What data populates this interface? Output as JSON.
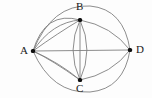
{
  "figure": {
    "name": "multigraph-abcd",
    "width": 152,
    "height": 98,
    "background_color": "#fdfdfd",
    "edge_color": "#808080",
    "vertex_color": "#101010",
    "label_color": "#1a1a1a"
  },
  "graph_data": {
    "type": "graph",
    "kind": "undirected-multigraph",
    "vertices": [
      {
        "id": "A",
        "label": "A",
        "x": 33,
        "y": 51,
        "label_x": 20,
        "label_y": 45
      },
      {
        "id": "B",
        "label": "B",
        "x": 80,
        "y": 20,
        "label_x": 76,
        "label_y": 1
      },
      {
        "id": "C",
        "label": "C",
        "x": 80,
        "y": 80,
        "label_x": 76,
        "label_y": 83
      },
      {
        "id": "D",
        "label": "D",
        "x": 130,
        "y": 50,
        "label_x": 136,
        "label_y": 44
      }
    ],
    "edges": [
      {
        "id": "e1",
        "from": "A",
        "to": "B",
        "multiplicity_index": 1,
        "path": "M 33 51 Q 45 10 80 20"
      },
      {
        "id": "e2",
        "from": "A",
        "to": "B",
        "multiplicity_index": 2,
        "path": "M 33 51 Q 52 22 80 20"
      },
      {
        "id": "e3",
        "from": "A",
        "to": "B",
        "multiplicity_index": 3,
        "path": "M 33 51 Q 58 33 80 20"
      },
      {
        "id": "e4",
        "from": "A",
        "to": "C",
        "multiplicity_index": 1,
        "path": "M 33 51 Q 52 60 80 80"
      },
      {
        "id": "e5",
        "from": "A",
        "to": "C",
        "multiplicity_index": 2,
        "path": "M 33 51 Q 60 63 80 80"
      },
      {
        "id": "e6",
        "from": "B",
        "to": "C",
        "multiplicity_index": 1,
        "path": "M 80 20 Q 66 50 80 80"
      },
      {
        "id": "e7",
        "from": "B",
        "to": "C",
        "multiplicity_index": 2,
        "path": "M 80 20 L 80 80"
      },
      {
        "id": "e8",
        "from": "B",
        "to": "C",
        "multiplicity_index": 3,
        "path": "M 80 20 Q 94 50 80 80"
      },
      {
        "id": "e9",
        "from": "B",
        "to": "D",
        "multiplicity_index": 1,
        "path": "M 80 20 Q 112 26 130 50"
      },
      {
        "id": "e10",
        "from": "C",
        "to": "D",
        "multiplicity_index": 1,
        "path": "M 80 80 Q 112 74 130 50"
      },
      {
        "id": "e11",
        "from": "A",
        "to": "D",
        "multiplicity_index": 1,
        "path": "M 33 51 L 130 50"
      },
      {
        "id": "e12",
        "from": "A",
        "to": "D",
        "multiplicity_index": 2,
        "path": "M 33 51 Q 52 4 90 6 Q 124 9 130 50",
        "via": "B-outer-top"
      },
      {
        "id": "e13",
        "from": "A",
        "to": "D",
        "multiplicity_index": 3,
        "path": "M 33 51 Q 52 94 90 92 Q 124 89 130 50",
        "via": "C-outer-bottom"
      }
    ],
    "degree": {
      "A": 8,
      "B": 8,
      "C": 7,
      "D": 5
    },
    "labels_visible": [
      "A",
      "B",
      "C",
      "D"
    ]
  }
}
